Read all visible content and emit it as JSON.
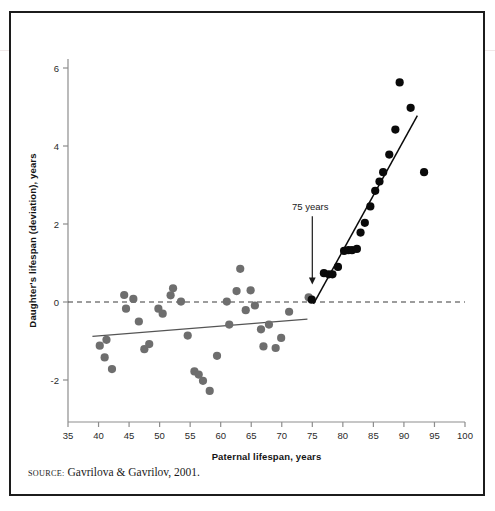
{
  "figure": {
    "source_keyword": "SOURCE:",
    "source_text": "Gavrilova & Gavrilov, 2001."
  },
  "chart_data": {
    "type": "scatter",
    "title": "",
    "xlabel": "Paternal lifespan, years",
    "ylabel": "Daughter's lifespan (deviation), years",
    "xlim": [
      35,
      100
    ],
    "ylim": [
      -2.9,
      6.9
    ],
    "xticks": [
      35,
      40,
      45,
      50,
      55,
      60,
      65,
      70,
      75,
      80,
      85,
      90,
      95,
      100
    ],
    "yticks": [
      6,
      4,
      2,
      0,
      -2
    ],
    "grid": false,
    "legend": null,
    "zero_reference_line": {
      "y": 0,
      "style": "dashed",
      "color": "#3a3a3a"
    },
    "annotations": [
      {
        "text": "75 years",
        "x": 75,
        "y": 2.35,
        "arrow_to_y": 0.45,
        "arrow": "down"
      }
    ],
    "series": [
      {
        "name": "Paternal lifespan below 75",
        "color": "#6e6e6e",
        "marker": "circle",
        "points": [
          [
            40.2,
            -1.12
          ],
          [
            41.0,
            -1.42
          ],
          [
            41.3,
            -0.97
          ],
          [
            42.2,
            -1.72
          ],
          [
            44.2,
            0.18
          ],
          [
            44.5,
            -0.17
          ],
          [
            45.7,
            0.08
          ],
          [
            46.6,
            -0.5
          ],
          [
            47.5,
            -1.21
          ],
          [
            48.3,
            -1.08
          ],
          [
            49.8,
            -0.17
          ],
          [
            50.5,
            -0.3
          ],
          [
            51.8,
            0.17
          ],
          [
            52.2,
            0.35
          ],
          [
            53.5,
            0.01
          ],
          [
            54.6,
            -0.86
          ],
          [
            55.7,
            -1.78
          ],
          [
            56.4,
            -1.86
          ],
          [
            57.1,
            -2.02
          ],
          [
            58.2,
            -2.28
          ],
          [
            59.4,
            -1.38
          ],
          [
            61.0,
            0.01
          ],
          [
            61.4,
            -0.58
          ],
          [
            62.6,
            0.28
          ],
          [
            63.2,
            0.85
          ],
          [
            64.1,
            -0.21
          ],
          [
            64.9,
            0.3
          ],
          [
            65.6,
            -0.09
          ],
          [
            66.6,
            -0.7
          ],
          [
            67.0,
            -1.14
          ],
          [
            67.9,
            -0.58
          ],
          [
            69.0,
            -1.18
          ],
          [
            69.9,
            -0.92
          ],
          [
            71.2,
            -0.25
          ],
          [
            74.4,
            0.12
          ]
        ]
      },
      {
        "name": "Paternal lifespan above 75",
        "color": "#0a0a0a",
        "marker": "circle",
        "points": [
          [
            74.9,
            0.06
          ],
          [
            76.9,
            0.74
          ],
          [
            77.7,
            0.71
          ],
          [
            78.3,
            0.71
          ],
          [
            79.2,
            0.9
          ],
          [
            80.2,
            1.31
          ],
          [
            80.9,
            1.33
          ],
          [
            81.5,
            1.33
          ],
          [
            82.3,
            1.36
          ],
          [
            82.9,
            1.78
          ],
          [
            83.6,
            2.03
          ],
          [
            84.5,
            2.45
          ],
          [
            85.3,
            2.85
          ],
          [
            86.0,
            3.09
          ],
          [
            86.6,
            3.33
          ],
          [
            87.6,
            3.78
          ],
          [
            88.6,
            4.42
          ],
          [
            89.3,
            5.63
          ],
          [
            91.1,
            4.98
          ],
          [
            93.3,
            3.33
          ]
        ]
      }
    ],
    "trend_lines": [
      {
        "name": "lower-segment-fit",
        "color": "#555555",
        "x_start": 39.0,
        "y_start": -0.88,
        "x_end": 74.2,
        "y_end": -0.44
      },
      {
        "name": "upper-segment-fit",
        "color": "#0a0a0a",
        "x_start": 75.2,
        "y_start": -0.05,
        "x_end": 92.2,
        "y_end": 4.78
      }
    ]
  }
}
